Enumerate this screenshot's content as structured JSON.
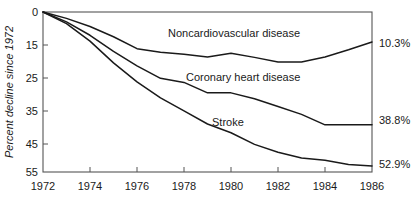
{
  "chart_data": {
    "type": "line",
    "title": "",
    "subtitle": "",
    "xlabel": "",
    "ylabel": "Percent decline since 1972",
    "x": [
      1972,
      1973,
      1974,
      1975,
      1976,
      1977,
      1978,
      1979,
      1980,
      1981,
      1982,
      1983,
      1984,
      1985,
      1986
    ],
    "xlim": [
      1972,
      1986
    ],
    "ylim": [
      0,
      55
    ],
    "y_inverted": true,
    "xticks": [
      1972,
      1974,
      1976,
      1978,
      1980,
      1982,
      1984,
      1986
    ],
    "xtick_labels": [
      "1972",
      "1974",
      "1976",
      "1978",
      "1980",
      "1982",
      "1984",
      "1986"
    ],
    "yticks": [
      0,
      15,
      25,
      35,
      45,
      55
    ],
    "ytick_labels": [
      "0",
      "15",
      "25",
      "35",
      "45",
      "55"
    ],
    "grid": false,
    "legend_position": "inline-labels",
    "series": [
      {
        "name": "Noncardiovascular disease",
        "label_text": "Noncardiovascular disease",
        "end_value_label": "10.3%",
        "values": [
          0.0,
          2.2,
          5.0,
          8.5,
          12.6,
          13.8,
          14.5,
          15.5,
          14.2,
          15.6,
          17.2,
          17.2,
          15.5,
          13.0,
          10.3
        ]
      },
      {
        "name": "Coronary heart disease",
        "label_text": "Coronary heart disease",
        "end_value_label": "38.8%",
        "values": [
          0.0,
          3.4,
          8.0,
          13.5,
          18.5,
          22.8,
          24.2,
          27.8,
          27.8,
          29.8,
          32.5,
          35.2,
          38.8,
          38.8,
          38.8
        ]
      },
      {
        "name": "Stroke",
        "label_text": "Stroke",
        "end_value_label": "52.9%",
        "values": [
          0.0,
          4.0,
          10.0,
          17.5,
          24.0,
          29.5,
          34.0,
          38.5,
          41.5,
          45.5,
          48.2,
          50.2,
          51.0,
          52.4,
          52.9
        ]
      }
    ],
    "series_label_positions": [
      {
        "x": 1977.2,
        "y": 7.0
      },
      {
        "x": 1978.2,
        "y": 23.0
      },
      {
        "x": 1979.0,
        "y": 36.0
      }
    ]
  }
}
